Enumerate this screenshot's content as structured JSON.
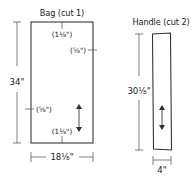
{
  "diagram": {
    "title_bag": "Bag (cut 1)",
    "title_handle": "Handle (cut 2)",
    "bag": {
      "height_label": "34\"",
      "width_label": "18⅛\"",
      "seam_top": "(1⅛\")",
      "seam_right": "(⅝\")",
      "seam_left": "(⅝\")",
      "seam_bottom": "(1⅛\")",
      "grain": "grain-arrow"
    },
    "handle": {
      "height_label": "30⅛\"",
      "width_label": "4\"",
      "grain": "grain-arrow"
    },
    "colors": {
      "ink": "#1a1a1a",
      "line": "#2e2e2e",
      "paper": "#ffffff"
    }
  }
}
